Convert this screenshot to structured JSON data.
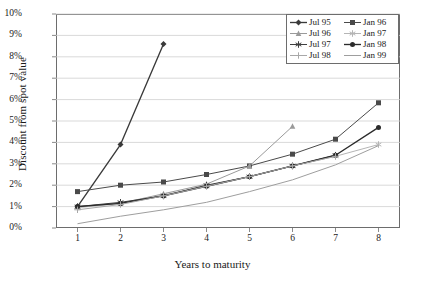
{
  "chart_data": {
    "type": "line",
    "title": "",
    "xlabel": "Years to maturity",
    "ylabel": "Discount from spot value",
    "x": [
      1,
      2,
      3,
      4,
      5,
      6,
      7,
      8
    ],
    "xlim": [
      0.5,
      8.5
    ],
    "ylim": [
      0,
      10
    ],
    "ytick_labels": [
      "0%",
      "1%",
      "2%",
      "3%",
      "4%",
      "5%",
      "6%",
      "7%",
      "8%",
      "9%",
      "10%"
    ],
    "ytick_values": [
      0,
      1,
      2,
      3,
      4,
      5,
      6,
      7,
      8,
      9,
      10
    ],
    "xtick_labels": [
      "1",
      "2",
      "3",
      "4",
      "5",
      "6",
      "7",
      "8"
    ],
    "grid": "horizontal",
    "legend_position": "top-right",
    "y_unit": "percent",
    "series": [
      {
        "name": "Jul 95",
        "marker": "diamond",
        "color": "#3a3a3a",
        "x": [
          1,
          2,
          3
        ],
        "values": [
          1.0,
          3.9,
          8.6
        ]
      },
      {
        "name": "Jan 96",
        "marker": "square",
        "color": "#4a4a4a",
        "x": [
          1,
          2,
          3,
          4,
          5,
          6,
          7,
          8
        ],
        "values": [
          1.7,
          2.0,
          2.15,
          2.5,
          2.9,
          3.45,
          4.15,
          5.85
        ]
      },
      {
        "name": "Jul 96",
        "marker": "triangle",
        "color": "#9a9a9a",
        "x": [
          1,
          2,
          3,
          4,
          5,
          6
        ],
        "values": [
          1.0,
          1.15,
          1.6,
          2.05,
          2.9,
          4.75
        ]
      },
      {
        "name": "Jan 97",
        "marker": "star",
        "color": "#b5b5b5",
        "x": [
          1,
          2,
          3,
          4,
          5,
          6,
          7,
          8
        ],
        "values": [
          0.95,
          1.15,
          1.55,
          1.95,
          2.4,
          2.9,
          3.35,
          3.9
        ]
      },
      {
        "name": "Jul 97",
        "marker": "asterisk",
        "color": "#3f3f3f",
        "x": [
          1,
          2,
          3,
          4,
          5,
          6,
          7
        ],
        "values": [
          1.0,
          1.2,
          1.5,
          2.0,
          2.4,
          2.9,
          3.4
        ]
      },
      {
        "name": "Jan 98",
        "marker": "circle",
        "color": "#2b2b2b",
        "x": [
          1,
          2,
          3,
          4,
          5,
          6,
          7,
          8
        ],
        "values": [
          1.0,
          1.15,
          1.5,
          1.95,
          2.4,
          2.9,
          3.4,
          4.7
        ]
      },
      {
        "name": "Jul 98",
        "marker": "plus",
        "color": "#a8a8a8",
        "x": [
          1,
          2,
          3,
          4,
          5,
          6,
          7
        ],
        "values": [
          0.85,
          1.1,
          1.5,
          1.95,
          2.4,
          2.9,
          3.35
        ]
      },
      {
        "name": "Jan 99",
        "marker": "none",
        "color": "#9e9e9e",
        "x": [
          1,
          2,
          3,
          4,
          5,
          6,
          7,
          8
        ],
        "values": [
          0.2,
          0.55,
          0.85,
          1.2,
          1.7,
          2.25,
          2.95,
          3.85
        ]
      }
    ]
  },
  "legend": {
    "items": [
      {
        "label": "Jul 95"
      },
      {
        "label": "Jan 96"
      },
      {
        "label": "Jul 96"
      },
      {
        "label": "Jan 97"
      },
      {
        "label": "Jul 97"
      },
      {
        "label": "Jan 98"
      },
      {
        "label": "Jul 98"
      },
      {
        "label": "Jan 99"
      }
    ]
  },
  "axes": {
    "y_title": "Discount from spot value",
    "x_title": "Years to maturity"
  },
  "colors": {
    "frame": "#6d6d6d",
    "grid": "#cfcfcf",
    "background": "#ffffff",
    "text": "#1a1a1a"
  }
}
